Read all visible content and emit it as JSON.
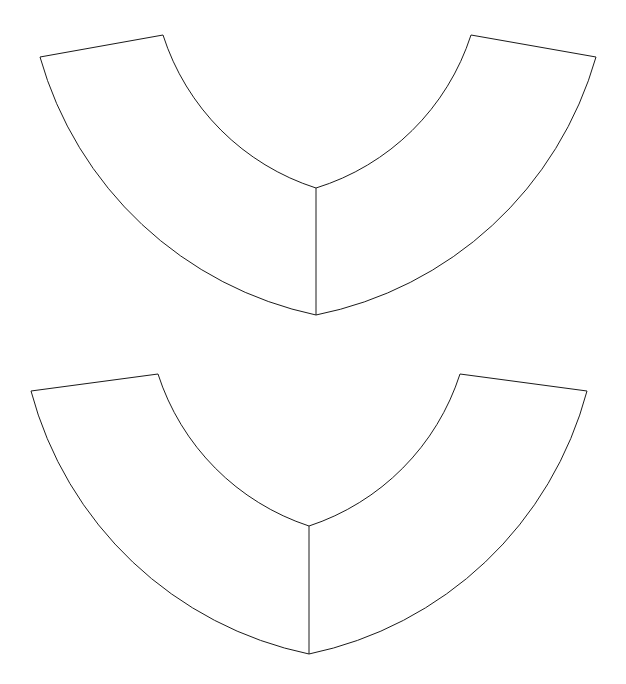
{
  "figure": {
    "background_color": "#ffffff",
    "stroke_color": "#1a1a1a",
    "stroke_width": 1,
    "fill_color": "#ffffff",
    "width": 626,
    "height": 684,
    "caption_ghost": "",
    "pieces": [
      {
        "id": "upper-piece",
        "label": "Upper annulus sector",
        "center_x": 316,
        "center_y": -48,
        "inner_radius": 236,
        "outer_radius": 365,
        "start_angle_deg": -100,
        "end_angle_deg": 100,
        "outer_left_x": 40,
        "outer_left_y": 57,
        "inner_left_x": 163,
        "inner_left_y": 35,
        "inner_right_x": 471,
        "inner_right_y": 35,
        "outer_right_x": 596,
        "outer_right_y": 57,
        "inner_bottom_x": 316,
        "inner_bottom_y": 188,
        "outer_bottom_x": 316,
        "outer_bottom_y": 315,
        "outline_path": "M 40 57 L 163 35 A 236 236 0 0 0 316 188 A 236 236 0 0 0 471 35 L 596 57 A 365 365 0 0 1 316 315 A 365 365 0 0 1 40 57 Z",
        "fold_line_path": "M 316 188 L 316 315"
      },
      {
        "id": "lower-piece",
        "label": "Lower annulus sector",
        "center_x": 309,
        "center_y": 290,
        "inner_radius": 236,
        "outer_radius": 364,
        "start_angle_deg": -100,
        "end_angle_deg": 100,
        "outer_left_x": 31,
        "outer_left_y": 391,
        "inner_left_x": 158,
        "inner_left_y": 374,
        "inner_right_x": 460,
        "inner_right_y": 374,
        "outer_right_x": 587,
        "outer_right_y": 391,
        "inner_bottom_x": 309,
        "inner_bottom_y": 526,
        "outer_bottom_x": 309,
        "outer_bottom_y": 654,
        "outline_path": "M 31 391 L 158 374 A 236 236 0 0 0 309 526 A 236 236 0 0 0 460 374 L 587 391 A 364 364 0 0 1 309 654 A 364 364 0 0 1 31 391 Z",
        "fold_line_path": "M 309 526 L 309 654"
      }
    ]
  }
}
